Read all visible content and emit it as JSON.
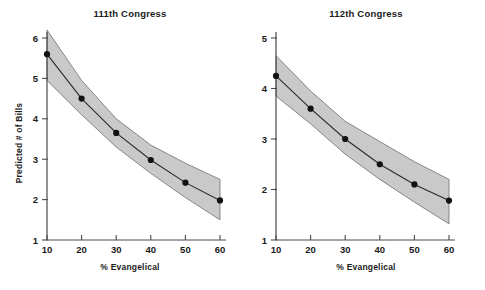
{
  "figure": {
    "ylabel": "Predicted # of Bills",
    "background": "#ffffff",
    "band_color": "#c9c9c9",
    "line_color": "#2a2a2a",
    "point_color": "#111111",
    "axis_color": "#4a4a4a"
  },
  "chart_data": [
    {
      "type": "line",
      "title": "111th Congress",
      "xlabel": "% Evangelical",
      "ylabel": "Predicted # of Bills",
      "grid": false,
      "legend": "none",
      "xlim": [
        10,
        60
      ],
      "ylim": [
        1,
        6
      ],
      "xticks": [
        10,
        20,
        30,
        40,
        50,
        60
      ],
      "yticks": [
        1,
        2,
        3,
        4,
        5,
        6
      ],
      "xtick_labels": [
        "10",
        "20",
        "30",
        "40",
        "50",
        "60"
      ],
      "ytick_labels": [
        "1",
        "2",
        "3",
        "4",
        "5",
        "6"
      ],
      "x": [
        10,
        20,
        30,
        40,
        50,
        60
      ],
      "values": [
        5.6,
        4.5,
        3.65,
        2.98,
        2.42,
        1.98
      ],
      "ci_upper": [
        6.2,
        4.95,
        4.0,
        3.35,
        2.9,
        2.5
      ],
      "ci_lower": [
        4.95,
        4.1,
        3.3,
        2.65,
        2.05,
        1.5
      ],
      "series": [
        {
          "name": "Predicted # of Bills",
          "values": [
            5.6,
            4.5,
            3.65,
            2.98,
            2.42,
            1.98
          ]
        }
      ]
    },
    {
      "type": "line",
      "title": "112th Congress",
      "xlabel": "% Evangelical",
      "ylabel": "Predicted # of Bills",
      "grid": false,
      "legend": "none",
      "xlim": [
        10,
        60
      ],
      "ylim": [
        1,
        5
      ],
      "xticks": [
        10,
        20,
        30,
        40,
        50,
        60
      ],
      "yticks": [
        1,
        2,
        3,
        4,
        5
      ],
      "xtick_labels": [
        "10",
        "20",
        "30",
        "40",
        "50",
        "60"
      ],
      "ytick_labels": [
        "1",
        "2",
        "3",
        "4",
        "5"
      ],
      "x": [
        10,
        20,
        30,
        40,
        50,
        60
      ],
      "values": [
        4.25,
        3.6,
        3.0,
        2.5,
        2.1,
        1.78
      ],
      "ci_upper": [
        4.65,
        3.95,
        3.35,
        2.95,
        2.55,
        2.2
      ],
      "ci_lower": [
        3.85,
        3.3,
        2.7,
        2.2,
        1.75,
        1.32
      ],
      "series": [
        {
          "name": "Predicted # of Bills",
          "values": [
            4.25,
            3.6,
            3.0,
            2.5,
            2.1,
            1.78
          ]
        }
      ]
    }
  ]
}
